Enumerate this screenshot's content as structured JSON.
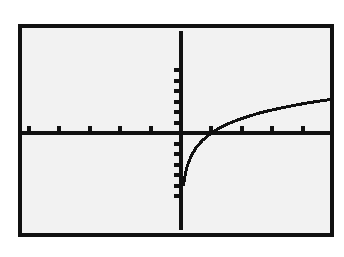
{
  "screen": {
    "title": "Graphing Calculator Screen",
    "device_label": "graphing-calculator",
    "background_color": "#ffffff",
    "screen_fill_color": "#f2f2f2",
    "frame_color": "#111111",
    "ink_color": "#111111",
    "frame": {
      "x": 18,
      "y": 24,
      "width": 316,
      "height": 213,
      "border_width": 4
    }
  },
  "chart_data": {
    "type": "line",
    "title": "",
    "subtitle": "",
    "xlabel": "",
    "ylabel": "",
    "grid": false,
    "legend": null,
    "legend_position": "none",
    "axis_style": "calculator-crosshair",
    "tick_labels_shown": false,
    "xlim": [
      -5.2,
      5.2
    ],
    "ylim": [
      -3.4,
      3.4
    ],
    "xticks": [
      -5,
      -4,
      -3,
      -2,
      -1,
      0,
      1,
      2,
      3,
      4,
      5
    ],
    "yticks": [
      -3,
      -2.5,
      -2,
      -1.5,
      -1,
      -0.5,
      0,
      0.5,
      1,
      1.5,
      2,
      2.5,
      3
    ],
    "x_tick_spacing": 1,
    "y_tick_spacing": 0.5,
    "origin_px": {
      "x": 159,
      "y": 105
    },
    "px_per_unit": {
      "x": 30.4,
      "y": 21.0
    },
    "series": [
      {
        "name": "y = ln(x)",
        "function": "ln(x)",
        "color": "#111111",
        "line_width": 3,
        "domain": [
          0.08,
          5.2
        ],
        "x": [
          0.08,
          0.12,
          0.18,
          0.25,
          0.35,
          0.5,
          0.7,
          0.9,
          1.1,
          1.4,
          1.7,
          2.0,
          2.3,
          2.6,
          3.0,
          3.4,
          3.8,
          4.2,
          4.6,
          5.0,
          5.2
        ],
        "y": [
          -2.53,
          -2.12,
          -1.71,
          -1.39,
          -1.05,
          -0.69,
          -0.36,
          -0.11,
          0.1,
          0.34,
          0.53,
          0.69,
          0.83,
          0.96,
          1.1,
          1.22,
          1.34,
          1.44,
          1.53,
          1.61,
          1.65
        ]
      }
    ],
    "annotations": []
  }
}
